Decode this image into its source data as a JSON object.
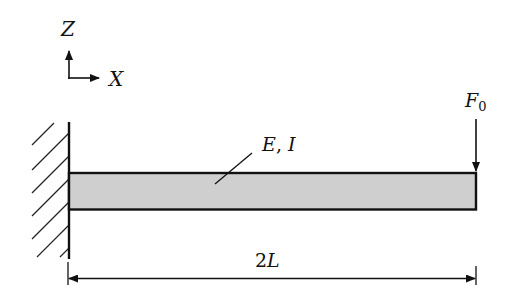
{
  "diagram": {
    "type": "cantilever-beam",
    "colors": {
      "stroke": "#111111",
      "beam_fill": "#cfcfcf",
      "background": "#ffffff"
    },
    "axes": {
      "z_label": "Z",
      "x_label": "X"
    },
    "beam": {
      "property_label": "E, I",
      "property_label_e": "E",
      "property_label_sep": ", ",
      "property_label_i": "I"
    },
    "load": {
      "label_main": "F",
      "label_sub": "0",
      "direction": "down"
    },
    "dimension": {
      "label_coef": "2",
      "label_var": "L"
    },
    "support": {
      "type": "fixed-wall",
      "side": "left"
    }
  }
}
